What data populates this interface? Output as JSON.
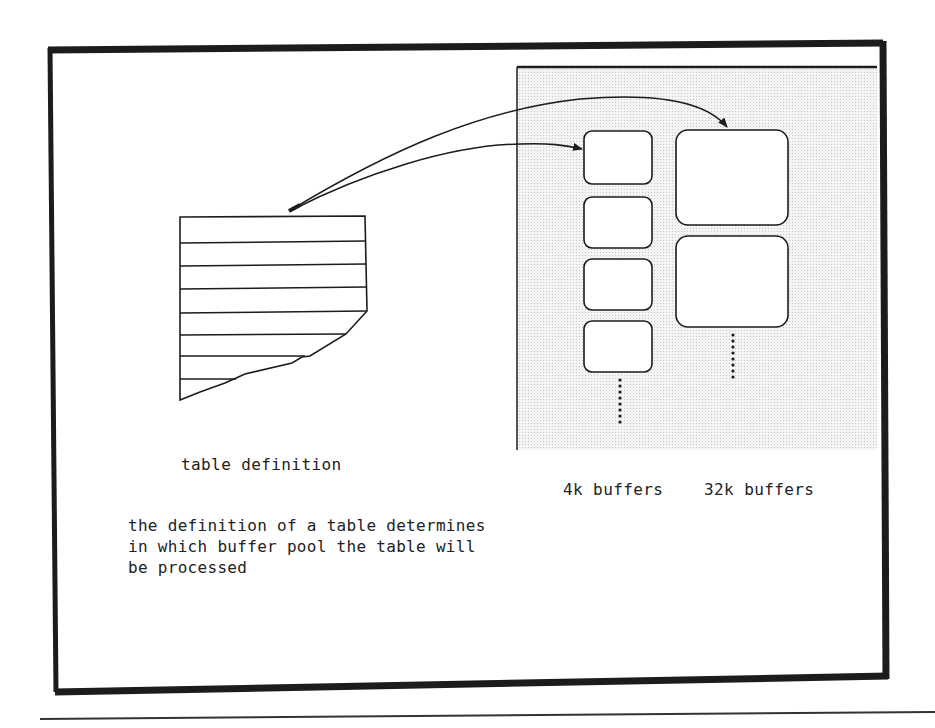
{
  "diagram": {
    "table_label": "table definition",
    "buffer_labels": {
      "small": "4k buffers",
      "large": "32k buffers"
    },
    "caption_lines": [
      "the definition of a table determines",
      "in which buffer pool the table will",
      "be processed"
    ],
    "buffer_pools": [
      {
        "name": "4k buffers",
        "visible_buffers": 4,
        "continues": true
      },
      {
        "name": "32k buffers",
        "visible_buffers": 2,
        "continues": true
      }
    ],
    "arrows": [
      {
        "from": "table definition",
        "to": "4k buffers"
      },
      {
        "from": "table definition",
        "to": "32k buffers"
      }
    ],
    "colors": {
      "ink": "#1c1c1c",
      "pool_background": "#ececec",
      "paper": "#ffffff"
    }
  }
}
